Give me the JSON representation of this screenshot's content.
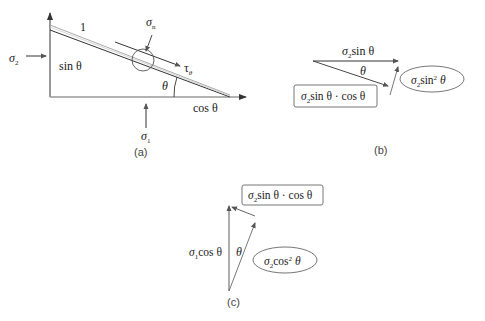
{
  "panel_a": {
    "caption": "(a)",
    "hyp_label": "1",
    "sigma_n": {
      "base": "σ",
      "sub": "n"
    },
    "tau_theta": {
      "base": "τ",
      "sub": "θ"
    },
    "sigma2": {
      "base": "σ",
      "sub": "2"
    },
    "sigma1": {
      "base": "σ",
      "sub": "1"
    },
    "sin_label": "sin θ",
    "cos_label": "cos θ",
    "theta": "θ"
  },
  "panel_b": {
    "caption": "(b)",
    "top_label": {
      "base": "σ",
      "sub": "2",
      "rest": "sin θ"
    },
    "theta": "θ",
    "box_label": {
      "base": "σ",
      "sub": "2",
      "rest": "sin θ · cos θ"
    },
    "ellipse_label": {
      "base": "σ",
      "sub": "2",
      "rest": "sin",
      "sup": "2",
      "tail": " θ"
    }
  },
  "panel_c": {
    "caption": "(c)",
    "box_label": {
      "base": "σ",
      "sub": "2",
      "rest": "sin θ · cos θ"
    },
    "left_label": {
      "base": "σ",
      "sub": "1",
      "rest": "cos θ"
    },
    "theta": "θ",
    "ellipse_label": {
      "base": "σ",
      "sub": "2",
      "rest": "cos",
      "sup": "2",
      "tail": " θ"
    }
  },
  "colors": {
    "line": "#333333",
    "light_line": "#aaaaaa",
    "base_line": "#999999"
  }
}
